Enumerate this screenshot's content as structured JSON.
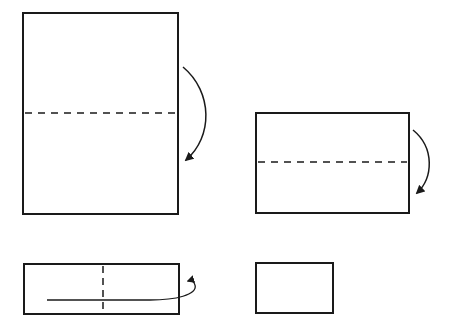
{
  "diagram": {
    "type": "paper-folding-steps",
    "background": "#ffffff",
    "stroke_color": "#1a1a1a",
    "steps": [
      {
        "id": "step-1",
        "shape": "tall-rectangle",
        "rect": {
          "x": 23,
          "y": 13,
          "w": 155,
          "h": 201
        },
        "fold_line": {
          "orientation": "horizontal",
          "style": "dashed",
          "y": 113
        },
        "arrow": {
          "direction": "fold-down",
          "side": "right"
        }
      },
      {
        "id": "step-2",
        "shape": "wide-rectangle",
        "rect": {
          "x": 256,
          "y": 113,
          "w": 153,
          "h": 100
        },
        "fold_line": {
          "orientation": "horizontal",
          "style": "dashed",
          "y": 162
        },
        "arrow": {
          "direction": "fold-down",
          "side": "right"
        }
      },
      {
        "id": "step-3",
        "shape": "long-strip-rectangle",
        "rect": {
          "x": 24,
          "y": 264,
          "w": 155,
          "h": 50
        },
        "fold_line": {
          "orientation": "vertical",
          "style": "dashed",
          "x": 103
        },
        "arrow": {
          "direction": "fold-right-to-left-behind",
          "side": "right"
        }
      },
      {
        "id": "step-4",
        "shape": "small-rectangle-result",
        "rect": {
          "x": 256,
          "y": 263,
          "w": 77,
          "h": 50
        }
      }
    ]
  }
}
